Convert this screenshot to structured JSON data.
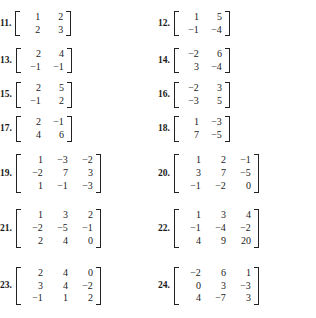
{
  "page": {
    "kind": "textbook-exercise-list"
  },
  "exercises": [
    {
      "number": "11.",
      "size": "2x2",
      "rows": [
        [
          "1",
          "2"
        ],
        [
          "2",
          "3"
        ]
      ]
    },
    {
      "number": "12.",
      "size": "2x2",
      "rows": [
        [
          "1",
          "5"
        ],
        [
          "−1",
          "−4"
        ]
      ]
    },
    {
      "number": "13.",
      "size": "2x2",
      "rows": [
        [
          "2",
          "4"
        ],
        [
          "−1",
          "−1"
        ]
      ]
    },
    {
      "number": "14.",
      "size": "2x2",
      "rows": [
        [
          "−2",
          "6"
        ],
        [
          "3",
          "−4"
        ]
      ]
    },
    {
      "number": "15.",
      "size": "2x2",
      "rows": [
        [
          "2",
          "5"
        ],
        [
          "−1",
          "2"
        ]
      ]
    },
    {
      "number": "16.",
      "size": "2x2",
      "rows": [
        [
          "−2",
          "3"
        ],
        [
          "−3",
          "5"
        ]
      ]
    },
    {
      "number": "17.",
      "size": "2x2",
      "rows": [
        [
          "2",
          "−1"
        ],
        [
          "4",
          "6"
        ]
      ]
    },
    {
      "number": "18.",
      "size": "2x2",
      "rows": [
        [
          "1",
          "−3"
        ],
        [
          "7",
          "−5"
        ]
      ]
    },
    {
      "number": "19.",
      "size": "3x3",
      "rows": [
        [
          "1",
          "−3",
          "−2"
        ],
        [
          "−2",
          "7",
          "3"
        ],
        [
          "1",
          "−1",
          "−3"
        ]
      ]
    },
    {
      "number": "20.",
      "size": "3x3",
      "rows": [
        [
          "1",
          "2",
          "−1"
        ],
        [
          "3",
          "7",
          "−5"
        ],
        [
          "−1",
          "−2",
          "0"
        ]
      ]
    },
    {
      "number": "21.",
      "size": "3x3",
      "rows": [
        [
          "1",
          "3",
          "2"
        ],
        [
          "−2",
          "−5",
          "−1"
        ],
        [
          "2",
          "4",
          "0"
        ]
      ]
    },
    {
      "number": "22.",
      "size": "3x3",
      "rows": [
        [
          "1",
          "3",
          "4"
        ],
        [
          "−1",
          "−4",
          "−2"
        ],
        [
          "4",
          "9",
          "20"
        ]
      ]
    },
    {
      "number": "23.",
      "size": "3x3",
      "rows": [
        [
          "2",
          "4",
          "0"
        ],
        [
          "3",
          "4",
          "−2"
        ],
        [
          "−1",
          "1",
          "2"
        ]
      ]
    },
    {
      "number": "24.",
      "size": "3x3",
      "rows": [
        [
          "−2",
          "6",
          "1"
        ],
        [
          "0",
          "3",
          "−3"
        ],
        [
          "4",
          "−7",
          "3"
        ]
      ]
    }
  ],
  "layout": {
    "rows": [
      {
        "left": 0,
        "right": 1,
        "class": "r1"
      },
      {
        "left": 2,
        "right": 3,
        "class": "r2"
      },
      {
        "left": 4,
        "right": 5,
        "class": "r3"
      },
      {
        "left": 6,
        "right": 7,
        "class": "r4"
      },
      {
        "left": 8,
        "right": 9,
        "class": "r5"
      },
      {
        "left": 10,
        "right": 11,
        "class": "r6"
      },
      {
        "left": 12,
        "right": 13,
        "class": "r7"
      }
    ]
  },
  "colors": {
    "background": "#ffffff",
    "text": "#1a1a1a",
    "bracket": "#222222"
  }
}
